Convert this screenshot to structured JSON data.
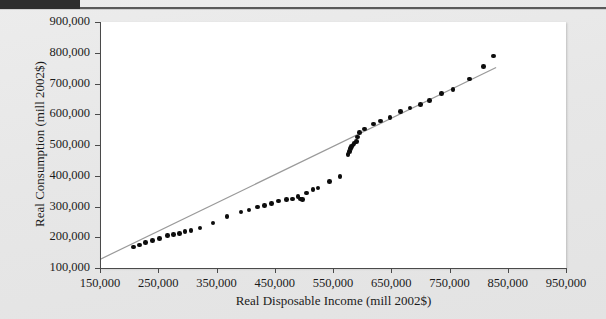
{
  "page": {
    "background_color": "#e9e9e9",
    "top_bar_color": "#2d2d2d",
    "rule_color": "#5a5a5a"
  },
  "chart_data": {
    "type": "scatter",
    "title": "",
    "xlabel": "Real Disposable Income (mill 2002$)",
    "ylabel": "Real Consumption (mill 2002$)",
    "xlim": [
      150000,
      950000
    ],
    "ylim": [
      100000,
      900000
    ],
    "xticks": [
      150000,
      250000,
      350000,
      450000,
      550000,
      650000,
      750000,
      850000,
      950000
    ],
    "yticks": [
      100000,
      200000,
      300000,
      400000,
      500000,
      600000,
      700000,
      800000,
      900000
    ],
    "xticklabels": [
      "150,000",
      "250,000",
      "350,000",
      "450,000",
      "550,000",
      "650,000",
      "750,000",
      "850,000",
      "950,000"
    ],
    "yticklabels": [
      "100,000",
      "200,000",
      "300,000",
      "400,000",
      "500,000",
      "600,000",
      "700,000",
      "800,000",
      "900,000"
    ],
    "grid": false,
    "legend": false,
    "marker_color": "#0d0d0d",
    "trendline_color": "#9a9a9a",
    "plot_background": "#ffffff",
    "points": [
      {
        "x": 208000,
        "y": 168000
      },
      {
        "x": 218000,
        "y": 175000
      },
      {
        "x": 228000,
        "y": 182000
      },
      {
        "x": 240000,
        "y": 190000
      },
      {
        "x": 252000,
        "y": 196000
      },
      {
        "x": 266000,
        "y": 205000
      },
      {
        "x": 276000,
        "y": 208000
      },
      {
        "x": 286000,
        "y": 212000
      },
      {
        "x": 296000,
        "y": 218000
      },
      {
        "x": 306000,
        "y": 221000
      },
      {
        "x": 322000,
        "y": 230000
      },
      {
        "x": 344000,
        "y": 246000
      },
      {
        "x": 368000,
        "y": 268000
      },
      {
        "x": 392000,
        "y": 282000
      },
      {
        "x": 406000,
        "y": 288000
      },
      {
        "x": 420000,
        "y": 298000
      },
      {
        "x": 432000,
        "y": 304000
      },
      {
        "x": 444000,
        "y": 310000
      },
      {
        "x": 456000,
        "y": 318000
      },
      {
        "x": 470000,
        "y": 322000
      },
      {
        "x": 480000,
        "y": 325000
      },
      {
        "x": 490000,
        "y": 332000
      },
      {
        "x": 494000,
        "y": 324000
      },
      {
        "x": 498000,
        "y": 322000
      },
      {
        "x": 504000,
        "y": 344000
      },
      {
        "x": 516000,
        "y": 355000
      },
      {
        "x": 524000,
        "y": 360000
      },
      {
        "x": 544000,
        "y": 382000
      },
      {
        "x": 562000,
        "y": 398000
      },
      {
        "x": 576000,
        "y": 470000
      },
      {
        "x": 578000,
        "y": 478000
      },
      {
        "x": 580000,
        "y": 488000
      },
      {
        "x": 582000,
        "y": 496000
      },
      {
        "x": 584000,
        "y": 500000
      },
      {
        "x": 586000,
        "y": 505000
      },
      {
        "x": 590000,
        "y": 512000
      },
      {
        "x": 592000,
        "y": 526000
      },
      {
        "x": 596000,
        "y": 540000
      },
      {
        "x": 604000,
        "y": 552000
      },
      {
        "x": 620000,
        "y": 568000
      },
      {
        "x": 632000,
        "y": 578000
      },
      {
        "x": 648000,
        "y": 590000
      },
      {
        "x": 666000,
        "y": 608000
      },
      {
        "x": 682000,
        "y": 620000
      },
      {
        "x": 700000,
        "y": 632000
      },
      {
        "x": 716000,
        "y": 645000
      },
      {
        "x": 736000,
        "y": 668000
      },
      {
        "x": 756000,
        "y": 680000
      },
      {
        "x": 784000,
        "y": 714000
      },
      {
        "x": 808000,
        "y": 755000
      },
      {
        "x": 826000,
        "y": 790000
      }
    ],
    "trendline": {
      "x_start": 150000,
      "y_start": 128000,
      "x_end": 830000,
      "y_end": 752000
    }
  }
}
